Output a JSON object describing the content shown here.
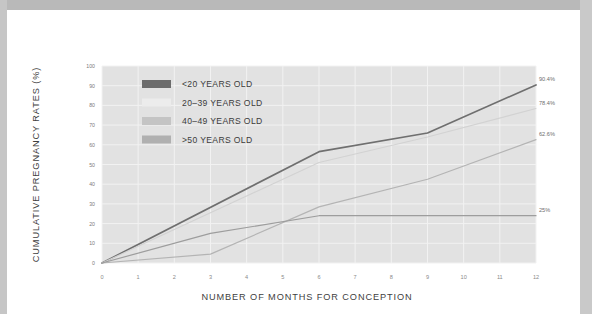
{
  "figure": {
    "plot_background": "#e2e2e2",
    "gridline_color": "#f2f2f2",
    "page_background": "#ffffff",
    "surround_band_color": "#bdbdbd"
  },
  "chart_data": {
    "type": "line",
    "title": "",
    "xlabel": "NUMBER OF MONTHS FOR CONCEPTION",
    "ylabel": "CUMULATIVE PREGNANCY RATES (%)",
    "xlim": [
      0,
      12
    ],
    "ylim": [
      0,
      100
    ],
    "xticks": [
      0,
      1,
      2,
      3,
      4,
      5,
      6,
      7,
      8,
      9,
      10,
      11,
      12
    ],
    "xtick_labels": [
      "0",
      "1",
      "2",
      "3",
      "4",
      "5",
      "6",
      "7",
      "8",
      "9",
      "10",
      "11",
      "12"
    ],
    "yticks": [
      0,
      10,
      20,
      30,
      40,
      50,
      60,
      70,
      80,
      90,
      100
    ],
    "ytick_labels": [
      "0",
      "10",
      "20",
      "30",
      "40",
      "50",
      "60",
      "70",
      "80",
      "90",
      "100"
    ],
    "grid": true,
    "legend_position": "upper-left-inside",
    "series": [
      {
        "name": "<20 YEARS OLD",
        "color": "#6f6f6f",
        "width": 1.7,
        "end_label": "90.4%",
        "x": [
          0,
          6,
          9,
          12
        ],
        "values": [
          0,
          56.5,
          66,
          90.4
        ]
      },
      {
        "name": "20–39 YEARS OLD",
        "color": "#d2d2d2",
        "width": 1.1,
        "end_label": "78.4%",
        "x": [
          0,
          6,
          9,
          12
        ],
        "values": [
          0,
          51,
          64,
          78.4
        ]
      },
      {
        "name": "40–49 YEARS OLD",
        "color": "#b4b4b4",
        "width": 1.2,
        "end_label": "62.6%",
        "x": [
          0,
          3,
          6,
          9,
          12
        ],
        "values": [
          0,
          4.5,
          28.5,
          42.5,
          62.6
        ]
      },
      {
        "name": ">50 YEARS OLD",
        "color": "#9d9d9d",
        "width": 1.2,
        "end_label": "25%",
        "x": [
          0,
          3,
          6,
          12
        ],
        "values": [
          0,
          15,
          24,
          24
        ]
      }
    ]
  },
  "legend": {
    "items": [
      {
        "label": "<20 YEARS OLD",
        "swatch": "#6c6c6c"
      },
      {
        "label": "20–39 YEARS OLD",
        "swatch": "#ececec"
      },
      {
        "label": "40–49 YEARS OLD",
        "swatch": "#c4c4c4"
      },
      {
        "label": ">50 YEARS OLD",
        "swatch": "#b0b0b0"
      }
    ]
  }
}
